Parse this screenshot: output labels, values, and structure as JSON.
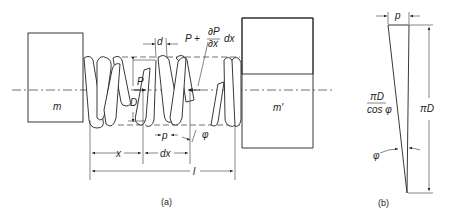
{
  "figure_a": {
    "caption": "(a)",
    "mass_left": "m",
    "mass_right": "m'",
    "labels": {
      "force_left": "P",
      "force_right_prefix": "P +",
      "partial_num": "∂P",
      "partial_den": "∂x",
      "force_right_suffix": "dx",
      "wire_diameter": "d",
      "coil_diameter": "D",
      "pitch": "p",
      "helix_angle": "φ",
      "position": "x",
      "element_length": "dx",
      "total_length": "l"
    }
  },
  "figure_b": {
    "caption": "(b)",
    "pitch": "p",
    "hyp_num": "πD",
    "hyp_den": "cos φ",
    "height": "πD",
    "angle": "φ"
  }
}
